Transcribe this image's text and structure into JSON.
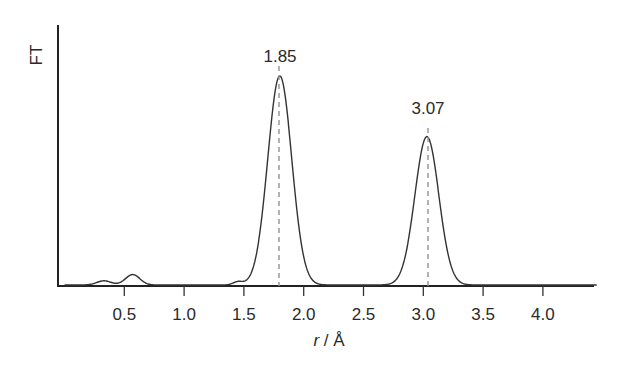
{
  "chart_data": {
    "type": "line",
    "title": "",
    "xlabel": "r / Å",
    "xlabel_italic_part": "r",
    "xlabel_rest": " / Å",
    "ylabel": "FT",
    "xlim": [
      0.0,
      4.45
    ],
    "x_ticks": [
      0.5,
      1.0,
      1.5,
      2.0,
      2.5,
      3.0,
      3.5,
      4.0
    ],
    "x_tick_labels": [
      "0.5",
      "1.0",
      "1.5",
      "2.0",
      "2.5",
      "3.0",
      "3.5",
      "4.0"
    ],
    "y_ticks": [],
    "grid": false,
    "legend": null,
    "series": [
      {
        "name": "FT",
        "peaks": [
          {
            "center": 0.33,
            "relative_height": 0.02,
            "width": 0.06
          },
          {
            "center": 0.57,
            "relative_height": 0.05,
            "width": 0.06
          },
          {
            "center": 1.45,
            "relative_height": 0.015,
            "width": 0.04
          },
          {
            "center": 1.8,
            "relative_height": 1.0,
            "width": 0.1
          },
          {
            "center": 3.03,
            "relative_height": 0.71,
            "width": 0.1
          }
        ]
      }
    ],
    "annotations": [
      {
        "text": "1.85",
        "x": 1.8,
        "marker": "dashed-vertical-line"
      },
      {
        "text": "3.07",
        "x": 3.03,
        "marker": "dashed-vertical-line"
      }
    ]
  },
  "labels": {
    "ylabel": "FT",
    "xlabel_r": "r",
    "xlabel_unit": " / Å",
    "peak1": "1.85",
    "peak2": "3.07",
    "ticks": [
      "0.5",
      "1.0",
      "1.5",
      "2.0",
      "2.5",
      "3.0",
      "3.5",
      "4.0"
    ]
  }
}
